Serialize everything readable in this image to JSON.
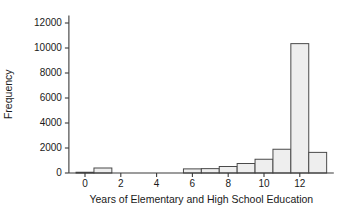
{
  "chart_data": {
    "type": "bar",
    "title": "",
    "subtitle": "",
    "xlabel": "Years of Elementary and High School Education",
    "ylabel": "Frequency",
    "xlim": [
      -0.9,
      13.9
    ],
    "ylim": [
      0,
      12600
    ],
    "grid": false,
    "legend": null,
    "bin_width": 1,
    "xticks": [
      0,
      2,
      4,
      6,
      8,
      10,
      12
    ],
    "xtick_labels": [
      "0",
      "2",
      "4",
      "6",
      "8",
      "10",
      "12"
    ],
    "yticks": [
      0,
      2000,
      4000,
      6000,
      8000,
      10000,
      12000
    ],
    "ytick_labels": [
      "0",
      "2000",
      "4000",
      "6000",
      "8000",
      "10000",
      "12000"
    ],
    "bar_fill": "#eeeeee",
    "bar_edge": "#4a4a4a",
    "axis_color": "#3a3a3a",
    "bins": [
      {
        "left": -0.5,
        "right": 0.5,
        "center": 0,
        "value": 60
      },
      {
        "left": 0.5,
        "right": 1.5,
        "center": 1,
        "value": 400
      },
      {
        "left": 5.5,
        "right": 6.5,
        "center": 6,
        "value": 330
      },
      {
        "left": 6.5,
        "right": 7.5,
        "center": 7,
        "value": 350
      },
      {
        "left": 7.5,
        "right": 8.5,
        "center": 8,
        "value": 520
      },
      {
        "left": 8.5,
        "right": 9.5,
        "center": 9,
        "value": 760
      },
      {
        "left": 9.5,
        "right": 10.5,
        "center": 10,
        "value": 1100
      },
      {
        "left": 10.5,
        "right": 11.5,
        "center": 11,
        "value": 1900
      },
      {
        "left": 11.5,
        "right": 12.5,
        "center": 12,
        "value": 10350
      },
      {
        "left": 12.5,
        "right": 13.5,
        "center": 13,
        "value": 1650
      }
    ],
    "categories": [
      "0",
      "1",
      "6",
      "7",
      "8",
      "9",
      "10",
      "11",
      "12",
      "13"
    ],
    "values": [
      60,
      400,
      330,
      350,
      520,
      760,
      1100,
      1900,
      10350,
      1650
    ]
  }
}
